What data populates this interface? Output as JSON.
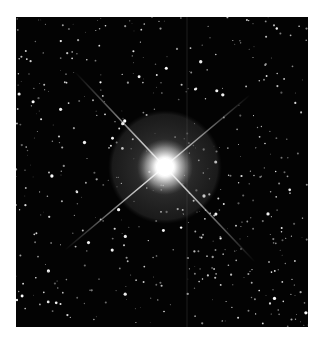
{
  "image": {
    "subject": "Bright star with diffraction spikes in a dense starfield",
    "background_color": "#ffffff",
    "frame": {
      "x": 16,
      "y": 17,
      "width": 292,
      "height": 310,
      "color": "#030303"
    },
    "bright_star": {
      "cx": 149,
      "cy": 150,
      "core_radius": 9,
      "glow_radius": 28,
      "halo_radius": 57,
      "halo_color": "#6a6a6a"
    },
    "spikes": [
      {
        "x1": 59,
        "y1": 55,
        "x2": 239,
        "y2": 245
      },
      {
        "x1": 234,
        "y1": 78,
        "x2": 49,
        "y2": 233
      }
    ],
    "artifact_line": {
      "x": 171,
      "color": "#262626"
    },
    "starfield": {
      "count": 520,
      "seed": 7,
      "max_radius": 1.4,
      "bright_count": 40
    }
  }
}
